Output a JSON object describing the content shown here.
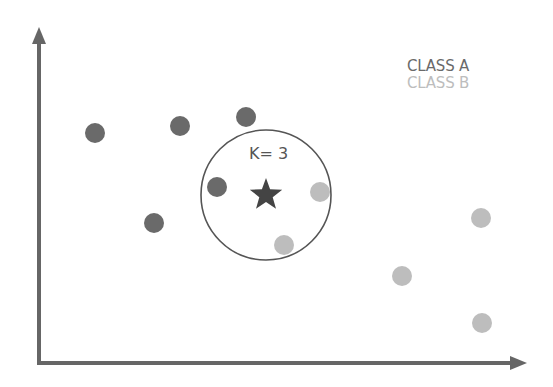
{
  "diagram": {
    "k_label": "K= 3",
    "legend": [
      {
        "label": "CLASS A",
        "color": "#6a6a6a"
      },
      {
        "label": "CLASS B",
        "color": "#bdbdbd"
      }
    ],
    "colors": {
      "axis": "#666666",
      "class_a": "#6a6a6a",
      "class_b": "#bdbdbd",
      "query": "#444444",
      "circle": "#555555"
    },
    "query_point": {
      "x": 266,
      "y": 195,
      "shape": "star"
    },
    "neighborhood_circle": {
      "cx": 266,
      "cy": 195,
      "r": 65
    },
    "points": [
      {
        "class": "A",
        "x": 95,
        "y": 133
      },
      {
        "class": "A",
        "x": 180,
        "y": 126
      },
      {
        "class": "A",
        "x": 246,
        "y": 117
      },
      {
        "class": "A",
        "x": 217,
        "y": 187
      },
      {
        "class": "A",
        "x": 154,
        "y": 223
      },
      {
        "class": "B",
        "x": 320,
        "y": 192
      },
      {
        "class": "B",
        "x": 284,
        "y": 245
      },
      {
        "class": "B",
        "x": 481,
        "y": 218
      },
      {
        "class": "B",
        "x": 402,
        "y": 276
      },
      {
        "class": "B",
        "x": 482,
        "y": 323
      }
    ]
  }
}
